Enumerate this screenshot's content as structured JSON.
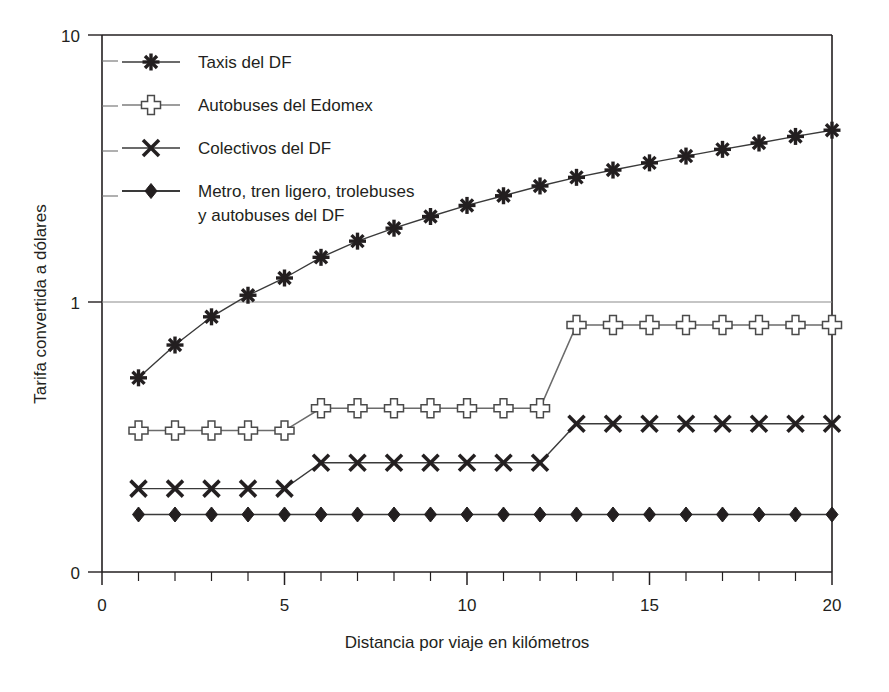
{
  "chart_data": {
    "type": "line",
    "title": "",
    "xlabel": "Distancia por viaje en kilómetros",
    "ylabel": "Tarifa convertida a dólares",
    "yscale": "log",
    "xlim": [
      0,
      20
    ],
    "ylim": [
      0.12,
      10
    ],
    "ytick_labels": [
      "10",
      "1",
      "0"
    ],
    "ytick_values": [
      10,
      1,
      0
    ],
    "xtick_labels": [
      "0",
      "5",
      "10",
      "15",
      "20"
    ],
    "xtick_values": [
      0,
      5,
      10,
      15,
      20
    ],
    "x_minor_tick_step": 1,
    "grid": "y-only-at-1",
    "legend_position": "upper-left-inside",
    "x": [
      1,
      2,
      3,
      4,
      5,
      6,
      7,
      8,
      9,
      10,
      11,
      12,
      13,
      14,
      15,
      16,
      17,
      18,
      19,
      20
    ],
    "series": [
      {
        "name": "Taxis del DF",
        "marker": "asterisk",
        "values": [
          0.52,
          0.69,
          0.88,
          1.06,
          1.23,
          1.47,
          1.69,
          1.89,
          2.09,
          2.3,
          2.5,
          2.72,
          2.93,
          3.12,
          3.32,
          3.52,
          3.73,
          3.94,
          4.17,
          4.4
        ]
      },
      {
        "name": "Autobuses del Edomex",
        "marker": "plus",
        "values": [
          0.33,
          0.33,
          0.33,
          0.33,
          0.33,
          0.4,
          0.4,
          0.4,
          0.4,
          0.4,
          0.4,
          0.4,
          0.82,
          0.82,
          0.82,
          0.82,
          0.82,
          0.82,
          0.82,
          0.82
        ]
      },
      {
        "name": "Colectivos del DF",
        "marker": "cross",
        "values": [
          0.2,
          0.2,
          0.2,
          0.2,
          0.2,
          0.25,
          0.25,
          0.25,
          0.25,
          0.25,
          0.25,
          0.25,
          0.35,
          0.35,
          0.35,
          0.35,
          0.35,
          0.35,
          0.35,
          0.35
        ]
      },
      {
        "name": "Metro, tren ligero, trolebuses y autobuses del DF",
        "marker": "diamond",
        "values": [
          0.16,
          0.16,
          0.16,
          0.16,
          0.16,
          0.16,
          0.16,
          0.16,
          0.16,
          0.16,
          0.16,
          0.16,
          0.16,
          0.16,
          0.16,
          0.16,
          0.16,
          0.16,
          0.16,
          0.16
        ]
      }
    ]
  },
  "legend": {
    "entries": [
      {
        "label": "Taxis del DF",
        "marker": "asterisk"
      },
      {
        "label": "Autobuses del Edomex",
        "marker": "plus"
      },
      {
        "label": "Colectivos del DF",
        "marker": "cross"
      },
      {
        "label": "Metro, tren ligero, trolebuses",
        "label_line2": "y autobuses del DF",
        "marker": "diamond"
      }
    ]
  },
  "colors": {
    "ink": "#231f20",
    "line": "#3a3a3a",
    "grid": "#8b8b8b",
    "axis": "#231f20",
    "background": "#ffffff",
    "marker_open": "#ffffff"
  }
}
